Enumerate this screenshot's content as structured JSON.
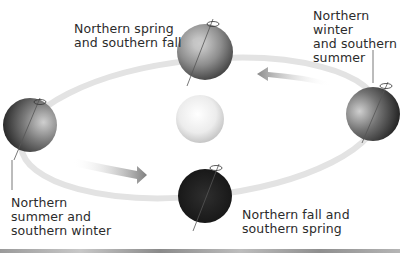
{
  "diagram": {
    "center": {
      "name": "Sun",
      "icon": "sun-icon"
    },
    "positions": [
      {
        "id": "top",
        "label_lines": [
          "Northern spring",
          "and southern fall"
        ],
        "shading": "half-lit"
      },
      {
        "id": "right",
        "label_lines": [
          "Northern",
          "winter",
          "and southern",
          "summer"
        ],
        "shading": "right-dark"
      },
      {
        "id": "bottom",
        "label_lines": [
          "Northern fall and",
          "southern spring"
        ],
        "shading": "dark"
      },
      {
        "id": "left",
        "label_lines": [
          "Northern",
          "summer and",
          "southern winter"
        ],
        "shading": "left-dark"
      }
    ],
    "arrows": [
      {
        "direction": "left",
        "location": "upper-right orbit"
      },
      {
        "direction": "right",
        "location": "lower-left orbit"
      }
    ],
    "colors": {
      "orbit": "#e6e6e6",
      "globe_light": "#d9d9d9",
      "globe_dark": "#1e1e1e",
      "sun": "#eeeeee",
      "text": "#2b2b2b"
    }
  }
}
